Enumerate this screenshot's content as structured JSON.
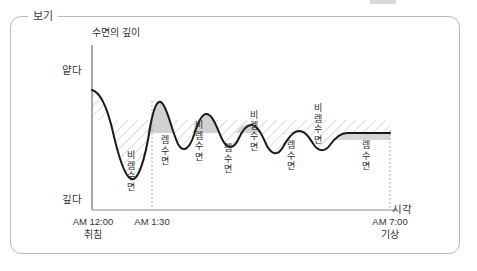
{
  "frame": {
    "legend": "보기"
  },
  "chart_data": {
    "type": "line",
    "title": "",
    "ylabel": "수면의 깊이",
    "xlabel": "시각",
    "y_axis_ticks": [
      "얕다",
      "깊다"
    ],
    "x_axis_ticks": [
      {
        "time": "AM 12:00",
        "note": "취침"
      },
      {
        "time": "AM 1:30",
        "note": ""
      },
      {
        "time": "AM 7:00",
        "note": "기상"
      }
    ],
    "grid": false,
    "legend_position": "none",
    "annotations": [
      {
        "label": "비렘수면",
        "x": 125,
        "y": 150,
        "phase": "non-rem"
      },
      {
        "label": "렘수면",
        "x": 159,
        "y": 135,
        "phase": "rem"
      },
      {
        "label": "비렘수면",
        "x": 193,
        "y": 120,
        "phase": "non-rem"
      },
      {
        "label": "렘수면",
        "x": 222,
        "y": 143,
        "phase": "rem"
      },
      {
        "label": "비렘수면",
        "x": 248,
        "y": 110,
        "phase": "non-rem"
      },
      {
        "label": "렘수면",
        "x": 285,
        "y": 140,
        "phase": "rem"
      },
      {
        "label": "비렘수면",
        "x": 312,
        "y": 103,
        "phase": "non-rem"
      },
      {
        "label": "렘수면",
        "x": 360,
        "y": 140,
        "phase": "rem"
      }
    ],
    "series": [
      {
        "name": "수면 깊이",
        "points": [
          [
            0.0,
            0.18
          ],
          [
            0.05,
            0.24
          ],
          [
            0.09,
            0.42
          ],
          [
            0.13,
            0.66
          ],
          [
            0.17,
            0.8
          ],
          [
            0.2,
            0.83
          ],
          [
            0.23,
            0.78
          ],
          [
            0.26,
            0.6
          ],
          [
            0.29,
            0.42
          ],
          [
            0.32,
            0.33
          ],
          [
            0.35,
            0.31
          ],
          [
            0.38,
            0.38
          ],
          [
            0.41,
            0.52
          ],
          [
            0.44,
            0.61
          ],
          [
            0.47,
            0.63
          ],
          [
            0.5,
            0.57
          ],
          [
            0.53,
            0.44
          ],
          [
            0.56,
            0.36
          ],
          [
            0.59,
            0.35
          ],
          [
            0.62,
            0.41
          ],
          [
            0.65,
            0.53
          ],
          [
            0.68,
            0.6
          ],
          [
            0.71,
            0.58
          ],
          [
            0.74,
            0.48
          ],
          [
            0.77,
            0.4
          ],
          [
            0.8,
            0.38
          ],
          [
            0.83,
            0.43
          ],
          [
            0.86,
            0.5
          ],
          [
            0.88,
            0.48
          ],
          [
            0.91,
            0.41
          ],
          [
            0.94,
            0.38
          ],
          [
            1.0,
            0.38
          ]
        ],
        "color": "#1a1a1a"
      }
    ],
    "x_domain": [
      "AM 12:00",
      "AM 7:00"
    ],
    "y_domain": [
      "얕다",
      "깊다"
    ],
    "rem_peaks_count": 4,
    "nonrem_troughs_count": 5
  }
}
